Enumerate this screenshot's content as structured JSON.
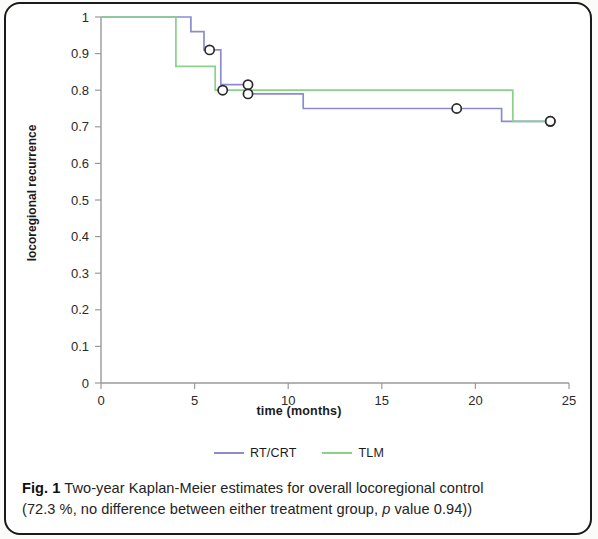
{
  "figure": {
    "label": "Fig. 1",
    "caption_line1": "Two-year Kaplan-Meier estimates for overall locoregional control",
    "caption_line2_pre": "(72.3 %, no difference between either treatment group, ",
    "caption_italic": "p",
    "caption_line2_post": " value 0.94))"
  },
  "legend": {
    "position": "bottom-center",
    "items": [
      {
        "label": "RT/CRT",
        "color": "#8a8ccf"
      },
      {
        "label": "TLM",
        "color": "#8ad18a"
      }
    ]
  },
  "chart_data": {
    "type": "line",
    "subtype": "kaplan-meier-step",
    "title": "",
    "xlabel": "time (months)",
    "ylabel": "locoregional recurrence",
    "xlim": [
      0,
      25
    ],
    "ylim": [
      0,
      1
    ],
    "xticks": [
      0,
      5,
      10,
      15,
      20,
      25
    ],
    "xtick_labels": [
      "0",
      "5",
      "10",
      "15",
      "20",
      "25"
    ],
    "yticks": [
      0,
      0.1,
      0.2,
      0.3,
      0.4,
      0.5,
      0.6,
      0.7,
      0.8,
      0.9,
      1
    ],
    "ytick_labels": [
      "0",
      "0.1",
      "0.2",
      "0.3",
      "0.4",
      "0.5",
      "0.6",
      "0.7",
      "0.8",
      "0.9",
      "1"
    ],
    "grid": false,
    "legend_position": "bottom",
    "series": [
      {
        "name": "RT/CRT",
        "color": "#8a8ccf",
        "steps": [
          [
            0,
            1.0
          ],
          [
            4.8,
            1.0
          ],
          [
            4.8,
            0.96
          ],
          [
            5.5,
            0.96
          ],
          [
            5.5,
            0.91
          ],
          [
            6.4,
            0.91
          ],
          [
            6.4,
            0.815
          ],
          [
            7.9,
            0.815
          ],
          [
            7.9,
            0.79
          ],
          [
            10.8,
            0.79
          ],
          [
            10.8,
            0.75
          ],
          [
            21.4,
            0.75
          ],
          [
            21.4,
            0.715
          ],
          [
            24.0,
            0.715
          ]
        ],
        "censored": [
          [
            5.8,
            0.91
          ],
          [
            7.85,
            0.815
          ],
          [
            7.85,
            0.79
          ],
          [
            19.0,
            0.75
          ],
          [
            24.0,
            0.715
          ]
        ]
      },
      {
        "name": "TLM",
        "color": "#8ad18a",
        "steps": [
          [
            0,
            1.0
          ],
          [
            4.0,
            1.0
          ],
          [
            4.0,
            0.865
          ],
          [
            6.1,
            0.865
          ],
          [
            6.1,
            0.8
          ],
          [
            22.0,
            0.8
          ],
          [
            22.0,
            0.715
          ],
          [
            24.0,
            0.715
          ]
        ],
        "censored": [
          [
            6.5,
            0.8
          ],
          [
            24.0,
            0.715
          ]
        ]
      }
    ],
    "annotations": [
      {
        "text": "72.3 %",
        "meaning": "overall locoregional control at two years"
      },
      {
        "text": "p value 0.94",
        "meaning": "no difference between treatment groups"
      }
    ]
  }
}
